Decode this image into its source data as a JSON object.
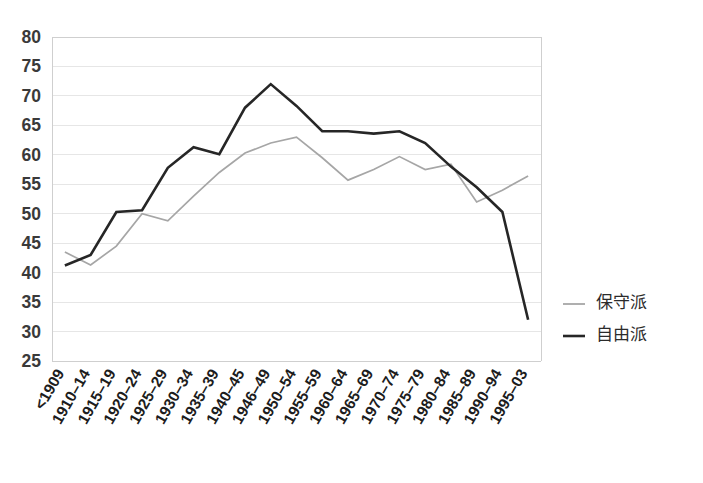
{
  "chart_data": {
    "type": "line",
    "title": "",
    "subtitle": "",
    "xlabel": "",
    "ylabel": "",
    "ylim": [
      25,
      80
    ],
    "ytick_step": 5,
    "grid": true,
    "legend_position": "right",
    "categories": [
      "<1909",
      "1910–14",
      "1915–19",
      "1920–24",
      "1925–29",
      "1930–34",
      "1935–39",
      "1940–45",
      "1946–49",
      "1950–54",
      "1955–59",
      "1960–64",
      "1965–69",
      "1970–74",
      "1975–79",
      "1980–84",
      "1985–89",
      "1990–94",
      "1995–03"
    ],
    "ytick_labels": [
      "80",
      "75",
      "70",
      "65",
      "60",
      "55",
      "50",
      "45",
      "40",
      "35",
      "30",
      "25"
    ],
    "series": [
      {
        "name": "保守派",
        "color": "#a6a6a6",
        "values": [
          43.5,
          41.3,
          44.5,
          50.0,
          48.8,
          53.0,
          57.0,
          60.3,
          62.0,
          63.0,
          59.5,
          55.7,
          57.5,
          59.7,
          57.5,
          58.4,
          52.0,
          54.0,
          56.4
        ]
      },
      {
        "name": "自由派",
        "color": "#262626",
        "values": [
          41.2,
          43.0,
          50.3,
          50.6,
          57.8,
          61.3,
          60.1,
          68.0,
          72.0,
          68.3,
          64.0,
          64.0,
          63.6,
          64.0,
          62.0,
          58.0,
          54.5,
          50.3,
          32.0
        ]
      }
    ]
  },
  "legend": {
    "items": [
      {
        "label": "保守派",
        "color": "#a6a6a6"
      },
      {
        "label": "自由派",
        "color": "#262626"
      }
    ]
  }
}
